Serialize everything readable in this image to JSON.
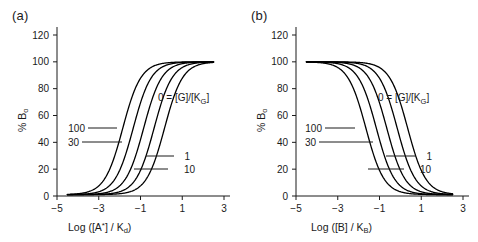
{
  "figure": {
    "background": "#ffffff",
    "curve_color": "#000000",
    "axis_color": "#1a1a1a"
  },
  "chart_data": [
    {
      "type": "line",
      "panel": "(a)",
      "title": "",
      "xlabel": "Log ([A*] / Kd)",
      "ylabel": "% Bo",
      "xlim": [
        -5,
        3
      ],
      "ylim": [
        0,
        120
      ],
      "xticks": [
        -5,
        -3,
        -1,
        1,
        3
      ],
      "yticks": [
        0,
        20,
        40,
        60,
        80,
        100,
        120
      ],
      "xtick_labels": [
        "-5",
        "-3",
        "-1",
        "1",
        "3"
      ],
      "ytick_labels": [
        "0",
        "20",
        "40",
        "60",
        "80",
        "100",
        "120"
      ],
      "grid": false,
      "legend": "inline-annotations",
      "direction": "ascending",
      "hill_slope": 1.0,
      "plateau_low": 1,
      "plateau_high": 100,
      "series": [
        {
          "name": "100",
          "ec50_log": -1.85,
          "label": "100"
        },
        {
          "name": "30",
          "ec50_log": -1.35,
          "label": "30"
        },
        {
          "name": "0",
          "ec50_log": -0.85,
          "label": "0"
        },
        {
          "name": "1",
          "ec50_log": -0.35,
          "label": "1"
        },
        {
          "name": "10",
          "ec50_log": 0.15,
          "label": "10"
        }
      ],
      "annotations": [
        {
          "text": "0 = [G]/[KG]",
          "role": "legend-key"
        },
        {
          "text": "100",
          "role": "curve-label"
        },
        {
          "text": "30",
          "role": "curve-label"
        },
        {
          "text": "1",
          "role": "curve-label"
        },
        {
          "text": "10",
          "role": "curve-label"
        }
      ]
    },
    {
      "type": "line",
      "panel": "(b)",
      "title": "",
      "xlabel": "Log ([B] / KB)",
      "ylabel": "% Bo",
      "xlim": [
        -5,
        3
      ],
      "ylim": [
        0,
        120
      ],
      "xticks": [
        -5,
        -3,
        -1,
        1,
        3
      ],
      "yticks": [
        0,
        20,
        40,
        60,
        80,
        100,
        120
      ],
      "xtick_labels": [
        "-5",
        "-3",
        "-1",
        "1",
        "3"
      ],
      "ytick_labels": [
        "0",
        "20",
        "40",
        "60",
        "80",
        "100",
        "120"
      ],
      "grid": false,
      "legend": "inline-annotations",
      "direction": "descending",
      "hill_slope": 1.0,
      "plateau_low": 1,
      "plateau_high": 100,
      "series": [
        {
          "name": "100",
          "ec50_log": -1.65,
          "label": "100"
        },
        {
          "name": "30",
          "ec50_log": -1.15,
          "label": "30"
        },
        {
          "name": "0",
          "ec50_log": -0.65,
          "label": "0"
        },
        {
          "name": "1",
          "ec50_log": -0.15,
          "label": "1"
        },
        {
          "name": "10",
          "ec50_log": 0.35,
          "label": "10"
        }
      ],
      "annotations": [
        {
          "text": "0 = [G]/[KG]",
          "role": "legend-key"
        },
        {
          "text": "100",
          "role": "curve-label"
        },
        {
          "text": "30",
          "role": "curve-label"
        },
        {
          "text": "1",
          "role": "curve-label"
        },
        {
          "text": "10",
          "role": "curve-label"
        }
      ]
    }
  ],
  "panel_a": {
    "tag": "(a)",
    "xlabel_prefix": "Log ([A",
    "xlabel_star": "*",
    "xlabel_mid": "] / K",
    "xlabel_sub": "d",
    "xlabel_suffix": ")",
    "ylabel_main": "% B",
    "ylabel_sub": "o",
    "key_main": "0 = [G]/[K",
    "key_sub": "G",
    "key_end": "]",
    "label_100": "100",
    "label_30": "30",
    "label_1": "1",
    "label_10": "10"
  },
  "panel_b": {
    "tag": "(b)",
    "xlabel_prefix": "Log ([B] / K",
    "xlabel_sub": "B",
    "xlabel_suffix": ")",
    "ylabel_main": "% B",
    "ylabel_sub": "o",
    "key_main": "0 = [G]/[K",
    "key_sub": "G",
    "key_end": "]",
    "label_100": "100",
    "label_30": "30",
    "label_1": "1",
    "label_10": "10"
  }
}
